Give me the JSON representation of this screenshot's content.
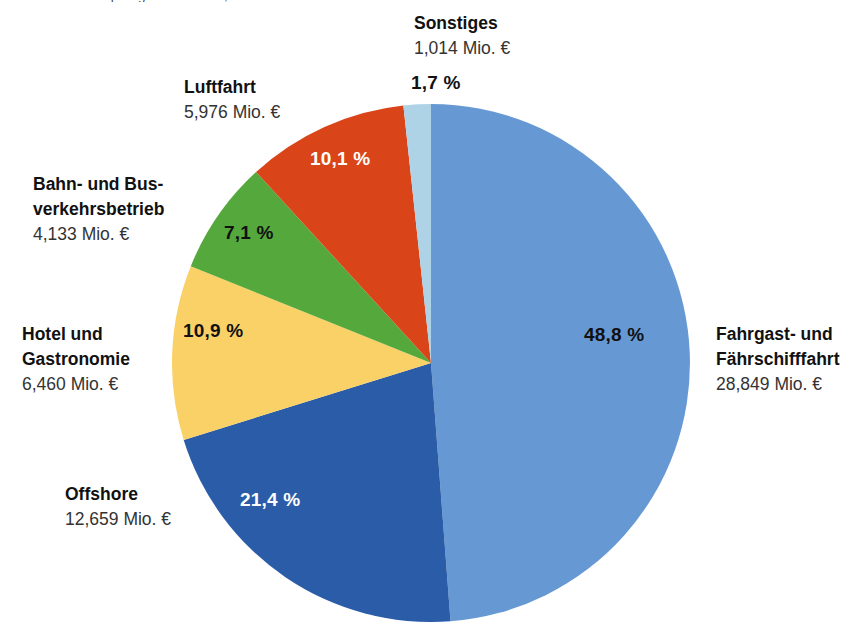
{
  "top_caption_remnant": "Bruttowertschöpfung in Mio. Euro, 2016",
  "chart_data": {
    "type": "pie",
    "title": "",
    "unit_label": "Mio. €",
    "start_angle_deg": 0,
    "direction": "clockwise",
    "legend_position": "outside-labels",
    "total_value": 59091,
    "categories": [
      "Fahrgast- und Fährschifffahrt",
      "Offshore",
      "Hotel und Gastronomie",
      "Bahn- und Busverkehrsbetrieb",
      "Luftfahrt",
      "Sonstiges"
    ],
    "values": [
      28849,
      12659,
      6460,
      4133,
      5976,
      1014
    ],
    "percent_values": [
      48.8,
      21.4,
      10.9,
      7.1,
      10.1,
      1.7
    ],
    "colors": [
      "#6699d4",
      "#2a5ca8",
      "#fad166",
      "#55a83c",
      "#d94518",
      "#afd3e6"
    ],
    "slices": [
      {
        "key": "fahrgast",
        "name_line1": "Fahrgast- und",
        "name_line2": "Fährschifffahrt",
        "value_text": "28,849 Mio. €",
        "percent_text": "48,8 %",
        "percent": 48.8,
        "value": 28849,
        "color": "#6699d4",
        "label_text_color": "#111111"
      },
      {
        "key": "offshore",
        "name_line1": "Offshore",
        "name_line2": "",
        "value_text": "12,659 Mio. €",
        "percent_text": "21,4 %",
        "percent": 21.4,
        "value": 12659,
        "color": "#2a5ca8",
        "label_text_color": "#ffffff"
      },
      {
        "key": "hotel",
        "name_line1": "Hotel und",
        "name_line2": "Gastronomie",
        "value_text": "6,460 Mio. €",
        "percent_text": "10,9 %",
        "percent": 10.9,
        "value": 6460,
        "color": "#fad166",
        "label_text_color": "#111111"
      },
      {
        "key": "bahn",
        "name_line1": "Bahn- und Bus-",
        "name_line2": "verkehrsbetrieb",
        "value_text": "4,133 Mio. €",
        "percent_text": "7,1 %",
        "percent": 7.1,
        "value": 4133,
        "color": "#55a83c",
        "label_text_color": "#111111"
      },
      {
        "key": "luftfahrt",
        "name_line1": "Luftfahrt",
        "name_line2": "",
        "value_text": "5,976 Mio. €",
        "percent_text": "10,1 %",
        "percent": 10.1,
        "value": 5976,
        "color": "#d94518",
        "label_text_color": "#ffffff"
      },
      {
        "key": "sonstiges",
        "name_line1": "Sonstiges",
        "name_line2": "",
        "value_text": "1,014 Mio. €",
        "percent_text": "1,7 %",
        "percent": 1.7,
        "value": 1014,
        "color": "#afd3e6",
        "label_text_color": "#111111"
      }
    ],
    "geometry": {
      "center_x": 431,
      "center_y": 363,
      "radius": 259
    }
  }
}
